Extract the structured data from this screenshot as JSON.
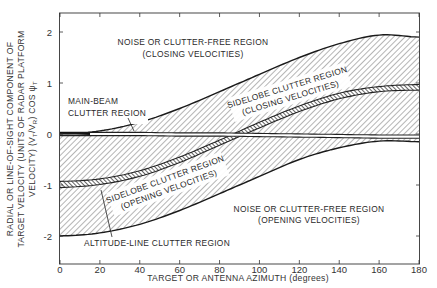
{
  "chart_data": {
    "type": "area",
    "title": "",
    "xlabel": "TARGET OR ANTENNA AZIMUTH (degrees)",
    "ylabel_lines": [
      "RADIAL OR LINE-OF-SIGHT COMPONENT OF",
      "TARGET VELOCITY (UNITS OF RADAR PLATFORM",
      "VELOCITY) (VT/VR) COS ψT"
    ],
    "xlim": [
      0,
      180
    ],
    "ylim": [
      -2.4,
      2.4
    ],
    "xticks": [
      0,
      20,
      40,
      60,
      80,
      100,
      120,
      140,
      160,
      180
    ],
    "yticks": [
      -2,
      -1,
      0,
      1,
      2
    ],
    "grid": false,
    "x": [
      0,
      20,
      40,
      60,
      80,
      100,
      120,
      140,
      160,
      180
    ],
    "series": [
      {
        "name": "Upper clutter boundary (sidelobe clutter, closing)",
        "values": [
          0.0,
          0.06,
          0.23,
          0.5,
          0.83,
          1.17,
          1.5,
          1.77,
          1.94,
          1.9
        ]
      },
      {
        "name": "Altitude-line clutter (upper edge)",
        "values": [
          -0.93,
          -0.88,
          -0.72,
          -0.45,
          -0.12,
          0.23,
          0.55,
          0.8,
          0.93,
          0.97
        ]
      },
      {
        "name": "Altitude-line clutter (lower edge)",
        "values": [
          -1.05,
          -0.99,
          -0.83,
          -0.56,
          -0.22,
          0.12,
          0.44,
          0.69,
          0.83,
          0.86
        ]
      },
      {
        "name": "Main-beam clutter",
        "values": [
          0.0,
          0.0,
          0.0,
          -0.01,
          -0.01,
          -0.02,
          -0.03,
          -0.04,
          -0.05,
          -0.05
        ]
      },
      {
        "name": "Lower clutter boundary (sidelobe clutter, opening)",
        "values": [
          -2.0,
          -1.94,
          -1.77,
          -1.5,
          -1.17,
          -0.83,
          -0.5,
          -0.27,
          -0.14,
          -0.15
        ]
      }
    ],
    "annotations": [
      {
        "text": "NOISE OR CLUTTER-FREE REGION",
        "sub": "(CLOSING VELOCITIES)",
        "region": "above upper boundary"
      },
      {
        "text": "SIDELOBE CLUTTER REGION",
        "sub": "(CLOSING VELOCITIES)",
        "region": "between main-beam and upper boundary"
      },
      {
        "text": "MAIN-BEAM",
        "sub": "CLUTTER REGION",
        "region": "line near 0 velocity"
      },
      {
        "text": "SIDELOBE CLUTTER REGION",
        "sub": "(OPENING VELOCITIES)",
        "region": "between lower boundary and main-beam"
      },
      {
        "text": "NOISE OR CLUTTER-FREE REGION",
        "sub": "(OPENING VELOCITIES)",
        "region": "below lower boundary"
      },
      {
        "text": "ALTITUDE-LINE CLUTTER REGION",
        "sub": "",
        "region": "narrow band ~ -cos(azimuth)"
      }
    ]
  },
  "labels": {
    "y_title_1": "RADIAL OR LINE-OF-SIGHT COMPONENT OF",
    "y_title_2": "TARGET VELOCITY (UNITS OF RADAR PLATFORM",
    "y_title_3": "VELOCITY) (V",
    "x_title": "TARGET OR ANTENNA AZIMUTH (degrees)",
    "closing_free_1": "NOISE OR CLUTTER-FREE REGION",
    "closing_free_2": "(CLOSING VELOCITIES)",
    "mainbeam_1": "MAIN-BEAM",
    "mainbeam_2": "CLUTTER REGION",
    "sidelobe_closing_1": "SIDELOBE CLUTTER REGION",
    "sidelobe_closing_2": "(CLOSING VELOCITIES)",
    "sidelobe_opening_1": "SIDELOBE CLUTTER REGION",
    "sidelobe_opening_2": "(OPENING VELOCITIES)",
    "opening_free_1": "NOISE OR CLUTTER-FREE REGION",
    "opening_free_2": "(OPENING VELOCITIES)",
    "altitude_line": "ALTITUDE-LINE CLUTTER REGION"
  },
  "colors": {
    "ink": "#222222",
    "hatch": "#555555",
    "background": "#ffffff"
  }
}
